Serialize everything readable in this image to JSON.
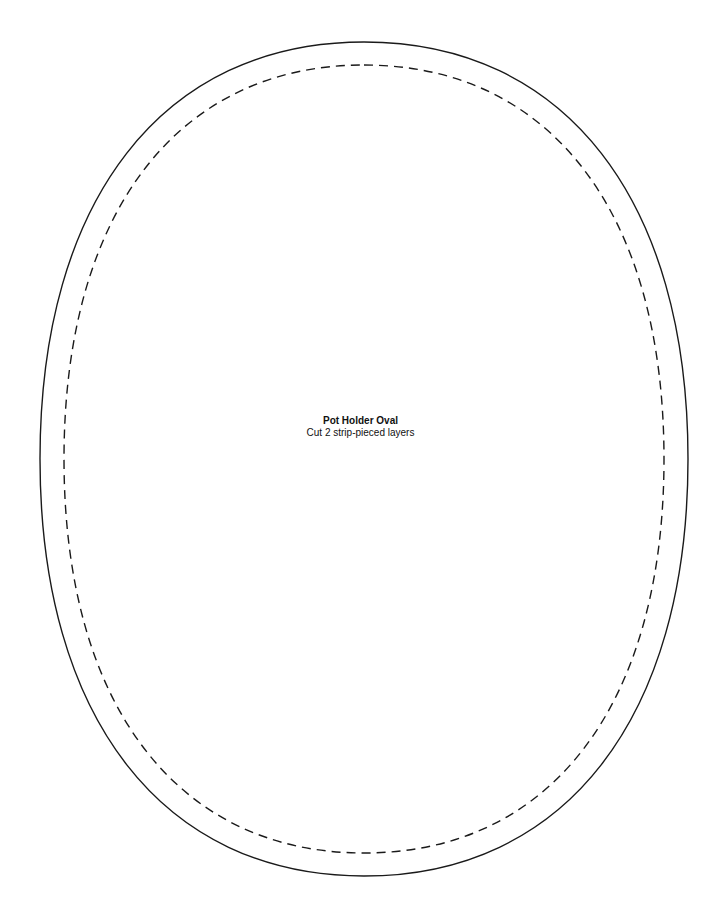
{
  "pattern": {
    "title": "Pot Holder Oval",
    "instruction": "Cut 2 strip-pieced layers",
    "cut_line": {
      "style": "solid",
      "color": "#1a1a1a",
      "cx": 364,
      "cy": 459,
      "rx": 324,
      "ry": 417
    },
    "seam_line": {
      "style": "dashed",
      "color": "#1a1a1a",
      "cx": 364,
      "cy": 459,
      "rx": 300,
      "ry": 394
    }
  }
}
